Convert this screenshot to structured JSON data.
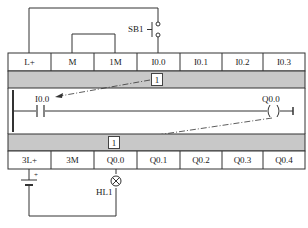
{
  "input_terminals": [
    "L+",
    "M",
    "1M",
    "I0.0",
    "I0.1",
    "I0.2",
    "I0.3"
  ],
  "output_terminals": [
    "3L+",
    "3M",
    "Q0.0",
    "Q0.1",
    "Q0.2",
    "Q0.3",
    "Q0.4"
  ],
  "input_image_bit": "1",
  "output_image_bit": "1",
  "ladder": {
    "contact_label": "I0.0",
    "coil_label": "Q0.0"
  },
  "components": {
    "switch_label": "SB1",
    "lamp_label": "HL1",
    "battery_polarity": "+"
  },
  "colors": {
    "line": "#333333",
    "band": "#c8c8c8",
    "background": "#ffffff"
  }
}
